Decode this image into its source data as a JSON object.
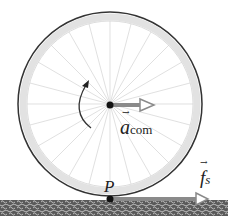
{
  "diagram": {
    "type": "rolling-wheel-free-body",
    "labels": {
      "acceleration": "a",
      "acceleration_sub": "com",
      "point": "P",
      "friction": "f",
      "friction_sub": "s",
      "vector_mark": "→"
    },
    "colors": {
      "wheel_rim": "#3a3a3a",
      "spokes": "#cfcfcf",
      "arrow": "#8a8a8a",
      "ground": "#4a4a4a",
      "dot": "#111111"
    }
  }
}
